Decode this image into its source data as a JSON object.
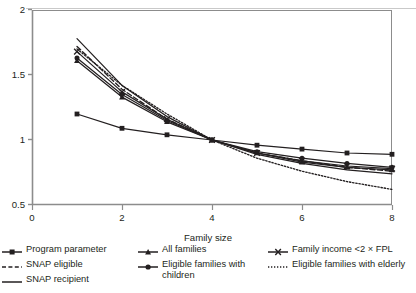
{
  "figure": {
    "background": "#ffffff",
    "ink_color": "#231f20",
    "axis_color": "#8c8c8c",
    "top_edge_color": "#c9c9c9"
  },
  "axes": {
    "x_title": "Family size",
    "y_title": "",
    "x_ticks": [
      "0",
      "2",
      "4",
      "6",
      "8"
    ],
    "y_ticks": [
      "0.5",
      "1",
      "1.5",
      "2"
    ]
  },
  "legend": {
    "columns": [
      {
        "items": [
          {
            "label": "Program parameter",
            "key": "line-square-marker"
          },
          {
            "label": "SNAP eligible",
            "key": "line-dashed"
          },
          {
            "label": "SNAP recipient",
            "key": "line-solid"
          }
        ]
      },
      {
        "items": [
          {
            "label": "All families",
            "key": "line-triangle-marker"
          },
          {
            "label": "Eligible families with children",
            "key": "line-circle-marker"
          }
        ]
      },
      {
        "items": [
          {
            "label": "Family income <2 × FPL",
            "key": "line-x-marker"
          },
          {
            "label": "Eligible families with elderly",
            "key": "line-dotted"
          }
        ]
      }
    ]
  },
  "chart_data": {
    "type": "line",
    "title": "",
    "xlabel": "Family size",
    "ylabel": "",
    "xlim": [
      0,
      8
    ],
    "ylim": [
      0.5,
      2
    ],
    "x_ticks": [
      0,
      2,
      4,
      6,
      8
    ],
    "y_ticks": [
      0.5,
      1,
      1.5,
      2
    ],
    "grid": false,
    "legend_position": "below",
    "x": [
      1,
      2,
      3,
      4,
      5,
      6,
      7,
      8
    ],
    "series": [
      {
        "name": "Program parameter",
        "marker": "square",
        "dash": "solid",
        "values": [
          1.2,
          1.09,
          1.04,
          1.0,
          0.96,
          0.93,
          0.9,
          0.89
        ]
      },
      {
        "name": "SNAP eligible",
        "marker": "none",
        "dash": "dashed",
        "values": [
          1.72,
          1.39,
          1.16,
          1.0,
          0.9,
          0.84,
          0.79,
          0.76
        ]
      },
      {
        "name": "SNAP recipient",
        "marker": "none",
        "dash": "solid",
        "values": [
          1.78,
          1.42,
          1.18,
          1.0,
          0.89,
          0.82,
          0.77,
          0.74
        ]
      },
      {
        "name": "All families",
        "marker": "triangle",
        "dash": "solid",
        "values": [
          1.61,
          1.33,
          1.14,
          1.0,
          0.9,
          0.83,
          0.79,
          0.77
        ]
      },
      {
        "name": "Eligible families with children",
        "marker": "circle",
        "dash": "solid",
        "values": [
          1.63,
          1.35,
          1.15,
          1.0,
          0.91,
          0.86,
          0.82,
          0.79
        ]
      },
      {
        "name": "Family income <2 × FPL",
        "marker": "x",
        "dash": "solid",
        "values": [
          1.68,
          1.37,
          1.16,
          1.0,
          0.9,
          0.84,
          0.8,
          0.78
        ]
      },
      {
        "name": "Eligible families with elderly",
        "marker": "none",
        "dash": "dotted",
        "values": [
          1.7,
          1.42,
          1.2,
          1.0,
          0.86,
          0.76,
          0.68,
          0.62
        ]
      }
    ]
  }
}
